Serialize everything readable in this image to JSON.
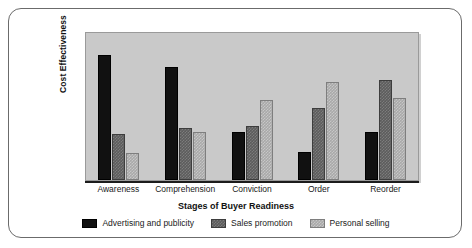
{
  "chart_data": {
    "type": "bar",
    "title": "",
    "subtitle": "",
    "xlabel": "Stages of Buyer Readiness",
    "ylabel": "Cost Effectiveness",
    "categories": [
      "Awareness",
      "Comprehension",
      "Conviction",
      "Order",
      "Reorder"
    ],
    "series": [
      {
        "name": "Advertising and publicity",
        "color": "#111111",
        "values": [
          84,
          76,
          32,
          19,
          32
        ]
      },
      {
        "name": "Sales promotion",
        "color": "#5c5c5c",
        "values": [
          31,
          35,
          36,
          48,
          67
        ]
      },
      {
        "name": "Personal selling",
        "color": "#a9a9a9",
        "values": [
          18,
          32,
          54,
          66,
          55
        ]
      }
    ],
    "ylim": [
      0,
      100
    ],
    "xlim_tick_labels_shown": true,
    "y_tick_labels_shown": false,
    "grid": false,
    "legend_position": "bottom",
    "plot_background": "#c9c9c9",
    "frame_border_color": "#6b6b6b"
  },
  "axes": {
    "y_title": "Cost Effectiveness",
    "x_title": "Stages of Buyer Readiness"
  },
  "legend": {
    "items": [
      {
        "label": "Advertising and publicity",
        "swatch": "legend-swatch-black"
      },
      {
        "label": "Sales promotion",
        "swatch": "legend-swatch-dark-gray"
      },
      {
        "label": "Personal selling",
        "swatch": "legend-swatch-light-gray"
      }
    ]
  }
}
